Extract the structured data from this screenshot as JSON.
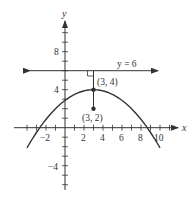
{
  "chart_data": {
    "type": "line",
    "title": "",
    "xlabel": "x",
    "ylabel": "y",
    "xlim": [
      -4.5,
      11.5
    ],
    "ylim": [
      -6.6,
      11
    ],
    "x_ticks": [
      -4,
      -3,
      -2,
      -1,
      0,
      1,
      2,
      3,
      4,
      5,
      6,
      7,
      8,
      9,
      10,
      11
    ],
    "x_tick_labels": [
      {
        "v": -2,
        "t": "−2"
      },
      {
        "v": 2,
        "t": "2"
      },
      {
        "v": 4,
        "t": "4"
      },
      {
        "v": 6,
        "t": "6"
      },
      {
        "v": 8,
        "t": "8"
      },
      {
        "v": 10,
        "t": "10"
      }
    ],
    "y_ticks": [
      -6,
      -5,
      -4,
      -3,
      -2,
      -1,
      1,
      2,
      3,
      4,
      5,
      6,
      7,
      8,
      9,
      10
    ],
    "y_tick_labels": [
      {
        "v": 8,
        "t": "8"
      },
      {
        "v": 4,
        "t": "4"
      },
      {
        "v": -4,
        "t": "−4"
      }
    ],
    "grid": false,
    "series": [
      {
        "name": "parabola",
        "equation": "y = 4 - (x-3)^2/8",
        "x_range": [
          -4,
          10
        ],
        "vertex": [
          3,
          4
        ]
      },
      {
        "name": "directrix",
        "equation": "y = 6",
        "label": "y = 6",
        "x_range": [
          -3.9,
          9.8
        ]
      }
    ],
    "points": [
      {
        "label": "(3, 4)",
        "x": 3,
        "y": 4,
        "role": "vertex"
      },
      {
        "label": "(3, 2)",
        "x": 3,
        "y": 2,
        "role": "focus"
      }
    ],
    "annotations": [
      "right-angle marker where x = 3 meets y = 6",
      "vertical segment from (3,2) to (3,6)"
    ]
  },
  "labels": {
    "x_axis": "x",
    "y_axis": "y",
    "directrix": "y = 6",
    "vertex": "(3, 4)",
    "focus": "(3, 2)",
    "xt_m2": "−2",
    "xt_2": "2",
    "xt_4": "4",
    "xt_6": "6",
    "xt_8": "8",
    "xt_10": "10",
    "yt_8": "8",
    "yt_4": "4",
    "yt_m4": "−4"
  },
  "colors": {
    "ink": "#333333"
  }
}
